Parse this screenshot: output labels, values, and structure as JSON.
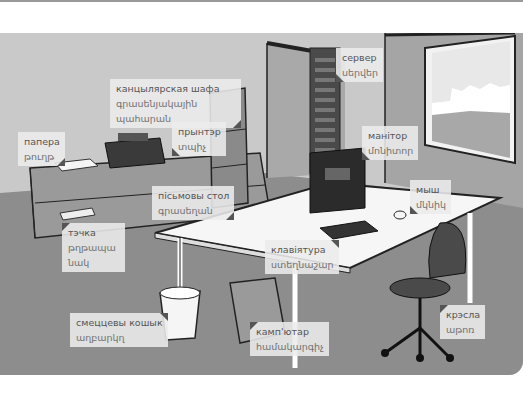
{
  "scene": {
    "title": "office vocabulary illustration",
    "colors": {
      "wall": "#c9c9c9",
      "floor": "#8f8f8f",
      "dark": "#333333",
      "label_bg": "#ececec"
    }
  },
  "labels": [
    {
      "id": "server",
      "ru": "сервер",
      "hy": "սերվեր"
    },
    {
      "id": "cabinet",
      "ru": "канцылярская шафа",
      "hy": "գրասենյակային պահարան"
    },
    {
      "id": "paper",
      "ru": "папера",
      "hy": "թուղթ"
    },
    {
      "id": "printer",
      "ru": "прынтэр",
      "hy": "տպիչ"
    },
    {
      "id": "monitor",
      "ru": "манітор",
      "hy": "մոնիտոր"
    },
    {
      "id": "desk",
      "ru": "пісьмовы стол",
      "hy": "գրասեղան"
    },
    {
      "id": "mouse",
      "ru": "мыш",
      "hy": "մկնիկ"
    },
    {
      "id": "stapler",
      "ru": "тэчка",
      "hy": "թղթապանակ"
    },
    {
      "id": "keyboard",
      "ru": "клавіятура",
      "hy": "ստեղնաշար"
    },
    {
      "id": "wastebasket",
      "ru": "смеццевы кошык",
      "hy": "աղբարկղ"
    },
    {
      "id": "computer",
      "ru": "камп'ютар",
      "hy": "համակարգիչ"
    },
    {
      "id": "chair",
      "ru": "крэсла",
      "hy": "աթոռ"
    }
  ]
}
